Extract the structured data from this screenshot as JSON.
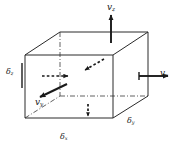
{
  "figure": {
    "type": "3d-control-volume",
    "stroke_color": "#1a1a1a",
    "background_color": "#ffffff",
    "labels": {
      "velocity_z": {
        "symbol": "v",
        "subscript": "z",
        "text": "vz"
      },
      "velocity_x": {
        "symbol": "v",
        "subscript": "x",
        "text": "vx"
      },
      "velocity_y": {
        "symbol": "v",
        "subscript": "y",
        "text": "vy"
      },
      "depth_z": {
        "symbol": "δ",
        "subscript": "z",
        "text": "δz"
      },
      "depth_x": {
        "symbol": "δ",
        "subscript": "x",
        "text": "δx"
      },
      "depth_y": {
        "symbol": "δ",
        "subscript": "y",
        "text": "δy"
      }
    },
    "arrows": [
      {
        "name": "velocity-z-arrow",
        "style": "solid",
        "direction": "up",
        "label": "vz"
      },
      {
        "name": "velocity-x-arrow",
        "style": "solid",
        "direction": "right",
        "label": "vx"
      },
      {
        "name": "velocity-y-arrow",
        "style": "solid",
        "direction": "down-left",
        "label": "vy"
      },
      {
        "name": "inflow-x-dashed-arrow",
        "style": "dashed",
        "direction": "right",
        "label": ""
      },
      {
        "name": "inflow-y-dashed-arrow",
        "style": "dashed",
        "direction": "down-left",
        "label": ""
      },
      {
        "name": "inflow-z-dashed-arrow",
        "style": "dashed",
        "direction": "down",
        "label": ""
      }
    ],
    "cube": {
      "front_face": "solid",
      "hidden_edges": "dash-dot",
      "vertices": {
        "front_top_left": [
          25,
          55
        ],
        "front_top_right": [
          113,
          55
        ],
        "front_bottom_left": [
          25,
          118
        ],
        "front_bottom_right": [
          113,
          118
        ],
        "back_top_left": [
          60,
          32
        ],
        "back_top_right": [
          148,
          32
        ],
        "back_bottom_left": [
          60,
          96
        ],
        "back_bottom_right": [
          148,
          96
        ]
      }
    }
  }
}
